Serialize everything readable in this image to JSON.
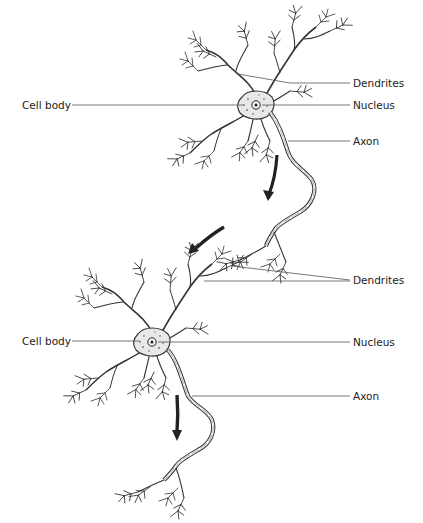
{
  "diagram": {
    "neurons": [
      {
        "id": "neuron-1",
        "labels": {
          "cell_body": "Cell body",
          "dendrites": "Dendrites",
          "nucleus": "Nucleus",
          "axon": "Axon"
        }
      },
      {
        "id": "neuron-2",
        "labels": {
          "cell_body": "Cell body",
          "dendrites": "Dendrites",
          "nucleus": "Nucleus",
          "axon": "Axon"
        }
      }
    ],
    "arrows": [
      {
        "name": "signal-arrow-1",
        "direction": "down"
      },
      {
        "name": "signal-arrow-2",
        "direction": "down-left"
      },
      {
        "name": "signal-arrow-3",
        "direction": "down"
      }
    ],
    "colors": {
      "ink": "#222222",
      "leader_line": "#555555",
      "cell_fill": "#e8e8e8",
      "background": "#ffffff"
    }
  }
}
